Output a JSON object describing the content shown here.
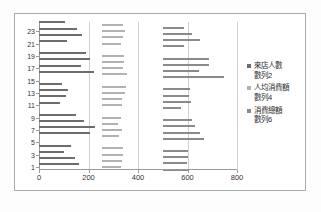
{
  "chart_data": {
    "type": "bar",
    "orientation": "horizontal",
    "title": "",
    "xlabel": "",
    "ylabel": "",
    "xlim": [
      0,
      800
    ],
    "xticks": [
      0,
      200,
      400,
      600,
      800
    ],
    "grid": true,
    "legend_position": "right",
    "categories": [
      1,
      2,
      3,
      4,
      5,
      6,
      7,
      8,
      9,
      10,
      11,
      12,
      13,
      14,
      15,
      16,
      17,
      18,
      19,
      20,
      21,
      22,
      23,
      24
    ],
    "ytick_labels": [
      "1",
      "3",
      "5",
      "7",
      "9",
      "11",
      "13",
      "15",
      "17",
      "19",
      "21",
      "23"
    ],
    "series": [
      {
        "name": "來店人數",
        "alt_name": "數列2",
        "color": "#6d6d6d",
        "values": [
          162,
          145,
          100,
          128,
          0,
          208,
          225,
          180,
          148,
          0,
          85,
          108,
          118,
          92,
          0,
          222,
          168,
          205,
          188,
          0,
          115,
          175,
          153,
          107
        ]
      },
      {
        "name": "人均消費額",
        "alt_name": "數列4",
        "color": "#b2b2b2",
        "base": 255,
        "values": [
          330,
          335,
          338,
          340,
          0,
          325,
          335,
          320,
          330,
          0,
          335,
          336,
          348,
          350,
          0,
          355,
          340,
          345,
          345,
          0,
          330,
          340,
          348,
          338
        ]
      },
      {
        "name": "消費總額",
        "alt_name": "數列6",
        "color": "#8a8a8a",
        "base": 500,
        "values": [
          605,
          598,
          600,
          600,
          0,
          665,
          652,
          630,
          620,
          0,
          572,
          615,
          608,
          612,
          0,
          748,
          648,
          688,
          685,
          0,
          585,
          650,
          618,
          585
        ]
      }
    ]
  },
  "legend": {
    "entries": [
      {
        "label": "來店人數",
        "sub": "數列2"
      },
      {
        "label": "人均消費額",
        "sub": "數列4"
      },
      {
        "label": "消費總額",
        "sub": "數列6"
      }
    ]
  }
}
